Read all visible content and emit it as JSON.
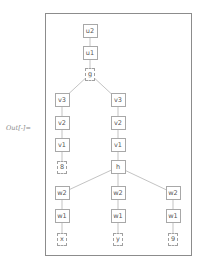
{
  "output_label": "Out[-]=",
  "colors": {
    "frame": "#8c8c8c",
    "node_border": "#a8a8a8",
    "edge": "#b4b4b4",
    "text": "#555555"
  },
  "tree": {
    "nodes": [
      {
        "id": "u2",
        "label": "u2",
        "type": "inner",
        "x": 90,
        "y": 31
      },
      {
        "id": "u1",
        "label": "u1",
        "type": "inner",
        "x": 90,
        "y": 53
      },
      {
        "id": "g",
        "label": "g",
        "type": "leaf",
        "x": 90,
        "y": 74
      },
      {
        "id": "v3a",
        "label": "v3",
        "type": "inner",
        "x": 62,
        "y": 100
      },
      {
        "id": "v2a",
        "label": "v2",
        "type": "inner",
        "x": 62,
        "y": 123
      },
      {
        "id": "v1a",
        "label": "v1",
        "type": "inner",
        "x": 62,
        "y": 145
      },
      {
        "id": "n8",
        "label": "8",
        "type": "leaf",
        "x": 62,
        "y": 167
      },
      {
        "id": "v3b",
        "label": "v3",
        "type": "inner",
        "x": 118,
        "y": 100
      },
      {
        "id": "v2b",
        "label": "v2",
        "type": "inner",
        "x": 118,
        "y": 123
      },
      {
        "id": "v1b",
        "label": "v1",
        "type": "inner",
        "x": 118,
        "y": 145
      },
      {
        "id": "h",
        "label": "h",
        "type": "inner",
        "x": 118,
        "y": 167
      },
      {
        "id": "w2a",
        "label": "w2",
        "type": "inner",
        "x": 62,
        "y": 193
      },
      {
        "id": "w1a",
        "label": "w1",
        "type": "inner",
        "x": 62,
        "y": 216
      },
      {
        "id": "x",
        "label": "x",
        "type": "leaf",
        "x": 62,
        "y": 239
      },
      {
        "id": "w2b",
        "label": "w2",
        "type": "inner",
        "x": 118,
        "y": 193
      },
      {
        "id": "w1b",
        "label": "w1",
        "type": "inner",
        "x": 118,
        "y": 216
      },
      {
        "id": "y",
        "label": "y",
        "type": "leaf",
        "x": 118,
        "y": 239
      },
      {
        "id": "w2c",
        "label": "w2",
        "type": "inner",
        "x": 173,
        "y": 193
      },
      {
        "id": "w1c",
        "label": "w1",
        "type": "inner",
        "x": 173,
        "y": 216
      },
      {
        "id": "n9",
        "label": "9",
        "type": "leaf",
        "x": 173,
        "y": 239
      }
    ],
    "edges": [
      [
        "u2",
        "u1"
      ],
      [
        "u1",
        "g"
      ],
      [
        "g",
        "v3a"
      ],
      [
        "g",
        "v3b"
      ],
      [
        "v3a",
        "v2a"
      ],
      [
        "v2a",
        "v1a"
      ],
      [
        "v1a",
        "n8"
      ],
      [
        "v3b",
        "v2b"
      ],
      [
        "v2b",
        "v1b"
      ],
      [
        "v1b",
        "h"
      ],
      [
        "h",
        "w2a"
      ],
      [
        "h",
        "w2b"
      ],
      [
        "h",
        "w2c"
      ],
      [
        "w2a",
        "w1a"
      ],
      [
        "w1a",
        "x"
      ],
      [
        "w2b",
        "w1b"
      ],
      [
        "w1b",
        "y"
      ],
      [
        "w2c",
        "w1c"
      ],
      [
        "w1c",
        "n9"
      ]
    ]
  }
}
